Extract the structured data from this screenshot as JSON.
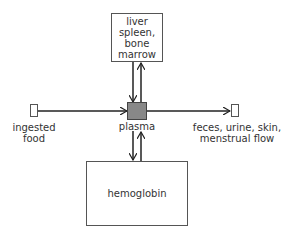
{
  "diagram": {
    "type": "flow",
    "nodes": {
      "organs": {
        "label": "liver\nspleen,\nbone\nmarrow"
      },
      "plasma": {
        "label": "plasma",
        "fill": "#888888"
      },
      "hemoglobin": {
        "label": "hemoglobin"
      },
      "source": {
        "label": "ingested\nfood"
      },
      "sink": {
        "label": "feces, urine, skin,\nmenstrual flow"
      }
    },
    "edges": [
      {
        "from": "source",
        "to": "plasma"
      },
      {
        "from": "plasma",
        "to": "sink"
      },
      {
        "from": "organs",
        "to": "plasma"
      },
      {
        "from": "plasma",
        "to": "organs"
      },
      {
        "from": "plasma",
        "to": "hemoglobin"
      },
      {
        "from": "hemoglobin",
        "to": "plasma"
      }
    ],
    "colors": {
      "line": "#222222",
      "box_border": "#555555",
      "plasma_fill": "#888888"
    }
  }
}
